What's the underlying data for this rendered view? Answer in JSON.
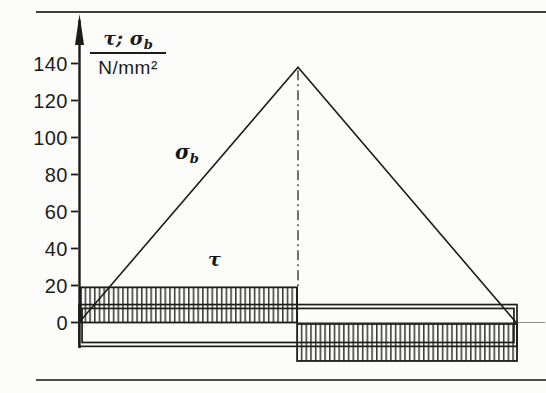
{
  "figure": {
    "axis_title": {
      "numerator_main": "τ; σ",
      "numerator_sub": "b",
      "denominator": "N/mm²"
    },
    "annotations": {
      "sigma_main": "σ",
      "sigma_sub": "b",
      "tau": "τ"
    }
  },
  "chart_data": {
    "type": "composite",
    "title": "",
    "xlabel": "",
    "ylabel": "τ; σb in N/mm²",
    "y_ticks": [
      140,
      120,
      100,
      80,
      60,
      40,
      20,
      0
    ],
    "ylim": [
      -24,
      152
    ],
    "grid": false,
    "legend": "none",
    "layout": {
      "plot_left_px": 79,
      "plot_right_px": 517,
      "zero_y_px": 322.5,
      "px_per_unit": 1.85,
      "axis_top_px": 18,
      "axis_bottom_px": 348,
      "zero_line_right_px": 545,
      "center_x_px": 298
    },
    "series": [
      {
        "name": "sigma_b_bending_stress",
        "kind": "line",
        "x_frac": [
          0.0,
          0.5,
          0.998
        ],
        "values": [
          0,
          138,
          0
        ]
      },
      {
        "name": "tau_hatched_left",
        "kind": "hatched-rect",
        "x_frac": [
          0.004,
          0.498
        ],
        "value_range": [
          19,
          0
        ]
      },
      {
        "name": "tau_hatched_right",
        "kind": "hatched-rect",
        "x_frac": [
          0.498,
          1.0
        ],
        "value_range": [
          -0.8,
          -20.8
        ]
      },
      {
        "name": "tau_band_outer",
        "kind": "outline-rect",
        "x_frac": [
          0.0,
          1.0
        ],
        "value_range": [
          9.7,
          -12.9
        ]
      },
      {
        "name": "tau_band_inner",
        "kind": "outline-rect",
        "x_frac": [
          0.007,
          0.993
        ],
        "value_range": [
          7.6,
          -10.8
        ]
      }
    ],
    "center_line": {
      "style": "dash-dot",
      "x_frac": 0.5,
      "from_value": 138,
      "to_value": 19
    }
  },
  "colors": {
    "ink": "#1c1c1c",
    "hatch": "#161616",
    "zero_line": "#8a8a8a",
    "separator_top": "#3f3f3f",
    "separator_bottom": "#4d4d4d",
    "background": "#fcfcfa"
  }
}
